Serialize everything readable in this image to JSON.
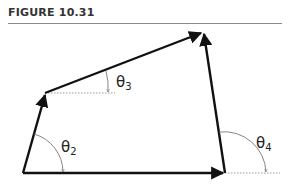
{
  "header": {
    "title": "FIGURE 10.31"
  },
  "diagram": {
    "type": "four-bar linkage vector loop",
    "vertices": {
      "A": [
        23,
        173
      ],
      "B": [
        45,
        93
      ],
      "C": [
        203,
        32
      ],
      "D": [
        225,
        173
      ]
    },
    "vectors": [
      {
        "name": "r2",
        "from": "A",
        "to": "B"
      },
      {
        "name": "r3",
        "from": "B",
        "to": "C"
      },
      {
        "name": "r4",
        "from": "D",
        "to": "C"
      },
      {
        "name": "r1",
        "from": "A",
        "to": "D"
      }
    ],
    "angles": [
      {
        "symbol": "θ",
        "subscript": "2",
        "at": "A"
      },
      {
        "symbol": "θ",
        "subscript": "3",
        "at": "B"
      },
      {
        "symbol": "θ",
        "subscript": "4",
        "at": "D"
      }
    ],
    "colors": {
      "link": "#111111",
      "reference": "#9a9a9a",
      "arc": "#777777"
    }
  },
  "labels": {
    "theta2": {
      "symbol": "θ",
      "sub": "2"
    },
    "theta3": {
      "symbol": "θ",
      "sub": "3"
    },
    "theta4": {
      "symbol": "θ",
      "sub": "4"
    }
  }
}
